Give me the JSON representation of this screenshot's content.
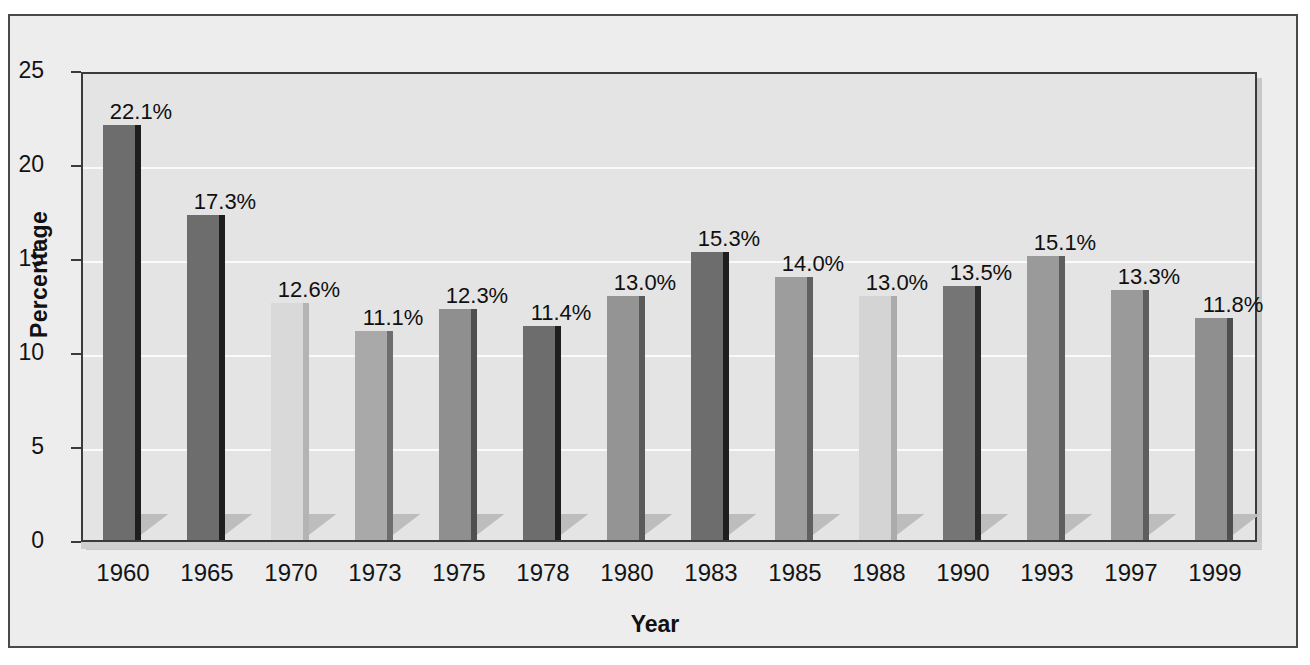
{
  "chart_data": {
    "type": "bar",
    "title": "",
    "xlabel": "Year",
    "ylabel": "Percentage",
    "categories": [
      "1960",
      "1965",
      "1970",
      "1973",
      "1975",
      "1978",
      "1980",
      "1983",
      "1985",
      "1988",
      "1990",
      "1993",
      "1997",
      "1999"
    ],
    "values": [
      22.1,
      17.3,
      12.6,
      11.1,
      12.3,
      11.4,
      13.0,
      15.3,
      14.0,
      13.0,
      13.5,
      15.1,
      13.3,
      11.8
    ],
    "value_labels": [
      "22.1%",
      "17.3%",
      "12.6%",
      "11.1%",
      "12.3%",
      "11.4%",
      "13.0%",
      "15.3%",
      "14.0%",
      "13.0%",
      "13.5%",
      "15.1%",
      "13.3%",
      "11.8%"
    ],
    "bar_colors": [
      "#6d6d6d",
      "#6d6d6d",
      "#d9d9d9",
      "#a9a9a9",
      "#8f8f8f",
      "#6d6d6d",
      "#949494",
      "#6d6d6d",
      "#9d9d9d",
      "#d4d4d4",
      "#757575",
      "#9a9a9a",
      "#9a9a9a",
      "#8f8f8f"
    ],
    "bar_side_colors": [
      "#1e1e1e",
      "#1e1e1e",
      "#b4b4b4",
      "#6e6e6e",
      "#4f4f4f",
      "#1e1e1e",
      "#5a5a5a",
      "#1e1e1e",
      "#606060",
      "#ababab",
      "#2a2a2a",
      "#5e5e5e",
      "#5e5e5e",
      "#4f4f4f"
    ],
    "ylim": [
      0,
      25
    ],
    "yticks": [
      0,
      5,
      10,
      15,
      20,
      25
    ],
    "ytick_labels": [
      "0",
      "5",
      "10",
      "15",
      "20",
      "25"
    ],
    "grid": true,
    "legend": "none",
    "plot_background": "#e4e4e4",
    "figure_background": "#ededed",
    "gridline_color": "#fafafa",
    "axis_color": "#3b3b3b",
    "text_color": "#111111"
  }
}
